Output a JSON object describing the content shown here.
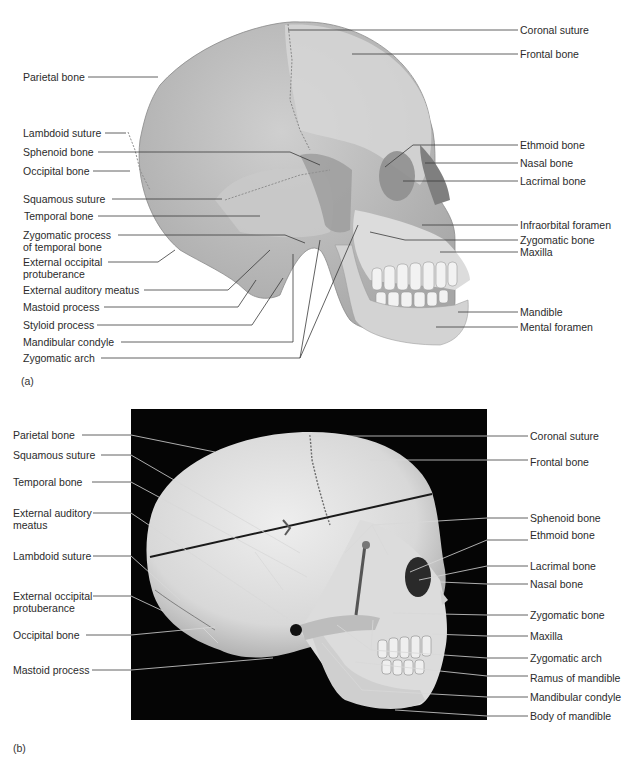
{
  "figure_a": {
    "panel_label": "(a)",
    "left_labels": [
      {
        "text": "Parietal bone"
      },
      {
        "text": "Lambdoid suture"
      },
      {
        "text": "Sphenoid bone"
      },
      {
        "text": "Occipital bone"
      },
      {
        "text": "Squamous suture"
      },
      {
        "text": "Temporal bone"
      },
      {
        "text": "Zygomatic process of temporal bone"
      },
      {
        "text": "External occipital protuberance"
      },
      {
        "text": "External auditory meatus"
      },
      {
        "text": "Mastoid process"
      },
      {
        "text": "Styloid process"
      },
      {
        "text": "Mandibular condyle"
      },
      {
        "text": "Zygomatic arch"
      }
    ],
    "right_labels": [
      {
        "text": "Coronal suture"
      },
      {
        "text": "Frontal bone"
      },
      {
        "text": "Ethmoid bone"
      },
      {
        "text": "Nasal bone"
      },
      {
        "text": "Lacrimal bone"
      },
      {
        "text": "Infraorbital foramen"
      },
      {
        "text": "Zygomatic bone"
      },
      {
        "text": "Maxilla"
      },
      {
        "text": "Mandible"
      },
      {
        "text": "Mental foramen"
      }
    ]
  },
  "figure_b": {
    "panel_label": "(b)",
    "left_labels": [
      {
        "text": "Parietal bone"
      },
      {
        "text": "Squamous suture"
      },
      {
        "text": "Temporal bone"
      },
      {
        "text": "External auditory meatus"
      },
      {
        "text": "Lambdoid suture"
      },
      {
        "text": "External occipital protuberance"
      },
      {
        "text": "Occipital bone"
      },
      {
        "text": "Mastoid process"
      }
    ],
    "right_labels": [
      {
        "text": "Coronal suture"
      },
      {
        "text": "Frontal bone"
      },
      {
        "text": "Sphenoid bone"
      },
      {
        "text": "Ethmoid bone"
      },
      {
        "text": "Lacrimal bone"
      },
      {
        "text": "Nasal bone"
      },
      {
        "text": "Zygomatic bone"
      },
      {
        "text": "Maxilla"
      },
      {
        "text": "Zygomatic arch"
      },
      {
        "text": "Ramus of mandible"
      },
      {
        "text": "Mandibular condyle"
      },
      {
        "text": "Body of mandible"
      }
    ]
  },
  "colors": {
    "background": "#ffffff",
    "label_text": "#2b2b2b",
    "leader_line": "#3a3a3a",
    "photo_background": "#050505",
    "bone_light": "#e4e4e4",
    "bone_mid": "#b9b9b9",
    "bone_dark": "#9a9a9a"
  }
}
